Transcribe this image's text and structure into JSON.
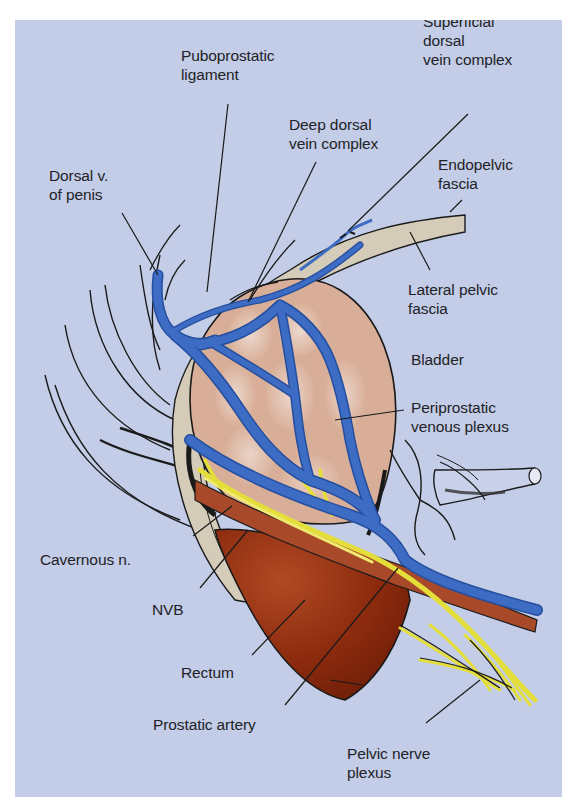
{
  "figure": {
    "background": "#c3cde8",
    "colors": {
      "vein": "#3d6cc4",
      "vein_dark": "#254e9e",
      "prostate": "#d8ae98",
      "prostate_highlight": "#ecd6cc",
      "fascia": "#d4cbb8",
      "nerve": "#e4de3a",
      "rectum": "#8c2a0e",
      "artery_band": "#a8492a",
      "ink": "#1a1a1a"
    }
  },
  "labels": {
    "puboprostatic_ligament": "Puboprostatic\nligament",
    "superficial_dorsal_vein_complex": "Superficial\ndorsal\nvein complex",
    "deep_dorsal_vein_complex": "Deep dorsal\nvein complex",
    "endopelvic_fascia": "Endopelvic\nfascia",
    "dorsal_v_of_penis": "Dorsal v.\nof penis",
    "lateral_pelvic_fascia": "Lateral pelvic\nfascia",
    "bladder": "Bladder",
    "periprostatic_venous_plexus": "Periprostatic\nvenous plexus",
    "cavernous_n": "Cavernous n.",
    "nvb": "NVB",
    "rectum": "Rectum",
    "prostatic_artery": "Prostatic artery",
    "pelvic_nerve_plexus": "Pelvic nerve\nplexus"
  }
}
